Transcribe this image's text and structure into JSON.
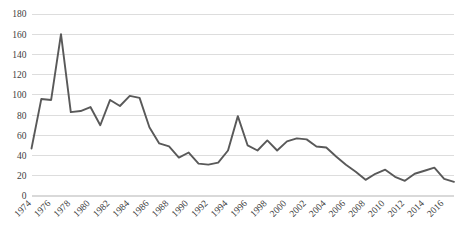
{
  "chart_data": {
    "type": "line",
    "title": "",
    "subtitle": "",
    "xlabel": "",
    "ylabel": "",
    "grid": "horizontal",
    "legend": "none",
    "xlim": [
      1974,
      2017
    ],
    "ylim": [
      0,
      180
    ],
    "ytick_step": 20,
    "ytick_labels": [
      "0",
      "20",
      "40",
      "60",
      "80",
      "100",
      "120",
      "140",
      "160",
      "180"
    ],
    "ytick_values": [
      0,
      20,
      40,
      60,
      80,
      100,
      120,
      140,
      160,
      180
    ],
    "xtick_labels": [
      "1974",
      "1976",
      "1978",
      "1980",
      "1982",
      "1984",
      "1986",
      "1988",
      "1990",
      "1992",
      "1994",
      "1996",
      "1998",
      "2000",
      "2002",
      "2004",
      "2006",
      "2008",
      "2010",
      "2012",
      "2014",
      "2016"
    ],
    "xtick_values": [
      1974,
      1976,
      1978,
      1980,
      1982,
      1984,
      1986,
      1988,
      1990,
      1992,
      1994,
      1996,
      1998,
      2000,
      2002,
      2004,
      2006,
      2008,
      2010,
      2012,
      2014,
      2016
    ],
    "x": [
      1974,
      1975,
      1976,
      1977,
      1978,
      1979,
      1980,
      1981,
      1982,
      1983,
      1984,
      1985,
      1986,
      1987,
      1988,
      1989,
      1990,
      1991,
      1992,
      1993,
      1994,
      1995,
      1996,
      1997,
      1998,
      1999,
      2000,
      2001,
      2002,
      2003,
      2004,
      2005,
      2006,
      2007,
      2008,
      2009,
      2010,
      2011,
      2012,
      2013,
      2014,
      2015,
      2016,
      2017
    ],
    "series": [
      {
        "name": "series-1",
        "color": "#595959",
        "values": [
          47,
          96,
          95,
          160,
          83,
          84,
          88,
          70,
          95,
          89,
          99,
          97,
          68,
          52,
          49,
          38,
          43,
          32,
          31,
          33,
          45,
          79,
          50,
          45,
          55,
          45,
          54,
          57,
          56,
          49,
          48,
          39,
          31,
          24,
          16,
          22,
          26,
          19,
          15,
          22,
          25,
          28,
          17,
          14
        ]
      }
    ]
  },
  "axes": {
    "y_axis_name": "y-axis",
    "x_axis_name": "x-axis"
  },
  "style": {
    "line_color": "#595959",
    "grid_color": "#d9d9d9",
    "text_color": "#404040",
    "background": "#ffffff"
  }
}
